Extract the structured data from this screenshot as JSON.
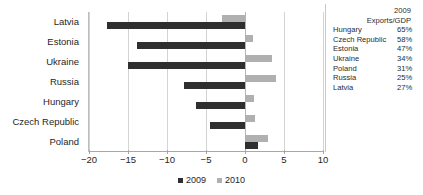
{
  "chart_data": {
    "type": "bar",
    "orientation": "horizontal",
    "title": "",
    "xlabel": "",
    "ylabel": "",
    "categories": [
      "Latvia",
      "Estonia",
      "Ukraine",
      "Russia",
      "Hungary",
      "Czech Republic",
      "Poland"
    ],
    "series": [
      {
        "name": "2009",
        "color": "#2f2f2f",
        "values": [
          -17.7,
          -13.8,
          -15.0,
          -7.8,
          -6.3,
          -4.5,
          1.7
        ]
      },
      {
        "name": "2010",
        "color": "#b0b0b0",
        "values": [
          -3.0,
          1.0,
          3.5,
          4.0,
          1.2,
          1.3,
          3.0
        ]
      }
    ],
    "xlim": [
      -20,
      10
    ],
    "xticks": [
      -20,
      -15,
      -10,
      -5,
      0,
      5,
      10
    ],
    "xtick_labels": [
      "−20",
      "−15",
      "−10",
      "−5",
      "0",
      "5",
      "10"
    ],
    "grid": true,
    "legend_position": "bottom"
  },
  "legend": {
    "items": [
      {
        "label": "2009",
        "color": "#2f2f2f"
      },
      {
        "label": "2010",
        "color": "#b0b0b0"
      }
    ]
  },
  "side_table": {
    "header_year": "2009",
    "header_metric": "Exports/GDP",
    "rows": [
      {
        "country": "Hungary",
        "value": "65%"
      },
      {
        "country": "Czech Republic",
        "value": "58%"
      },
      {
        "country": "Estonia",
        "value": "47%"
      },
      {
        "country": "Ukraine",
        "value": "34%"
      },
      {
        "country": "Poland",
        "value": "31%"
      },
      {
        "country": "Russia",
        "value": "25%"
      },
      {
        "country": "Latvia",
        "value": "27%"
      }
    ]
  }
}
